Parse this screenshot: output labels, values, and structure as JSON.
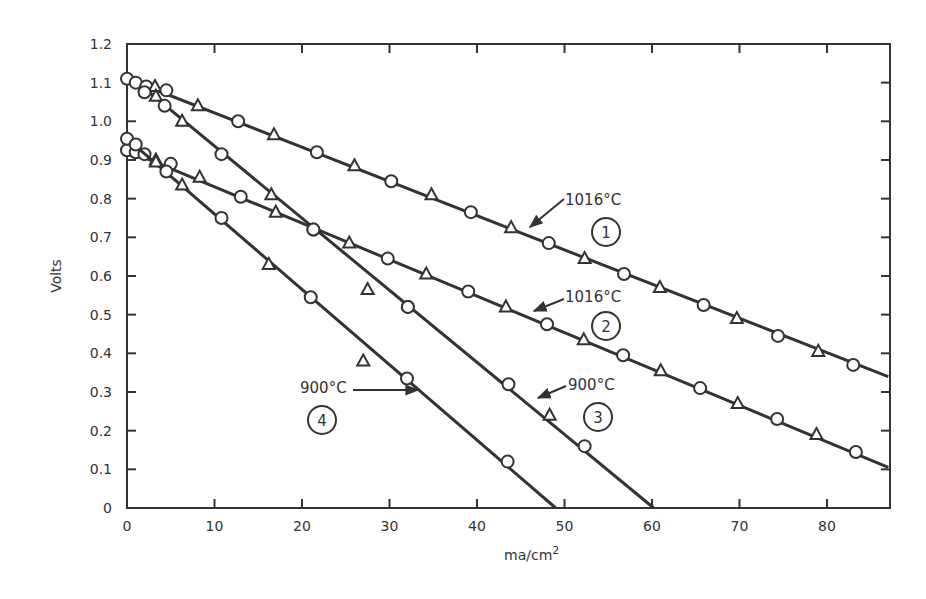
{
  "chart_data": {
    "type": "line",
    "title": "",
    "xlabel": "ma/cm",
    "xlabel_superscript": "2",
    "ylabel": "Volts",
    "xlim": [
      0,
      87
    ],
    "ylim": [
      0,
      1.2
    ],
    "grid": false,
    "legend": "none (inline annotations)",
    "x_ticks": [
      0,
      10,
      20,
      30,
      40,
      50,
      60,
      70,
      80
    ],
    "x_tick_labels": [
      "0",
      "10",
      "20",
      "30",
      "40",
      "50",
      "60",
      "70",
      "80"
    ],
    "y_ticks": [
      0,
      0.1,
      0.2,
      0.3,
      0.4,
      0.5,
      0.6,
      0.7,
      0.8,
      0.9,
      1.0,
      1.1,
      1.2
    ],
    "y_tick_labels": [
      "0",
      "0.1",
      "0.2",
      "0.3",
      "0.4",
      "0.5",
      "0.6",
      "0.7",
      "0.8",
      "0.9",
      "1.0",
      "1.1",
      "1.2"
    ],
    "series": [
      {
        "name": "1",
        "label": "1016°C",
        "line": [
          [
            0,
            1.11
          ],
          [
            87,
            0.34
          ]
        ],
        "points": [
          {
            "x": 0,
            "y": 1.11,
            "m": "o"
          },
          {
            "x": 1.0,
            "y": 1.1,
            "m": "o"
          },
          {
            "x": 2.2,
            "y": 1.09,
            "m": "o"
          },
          {
            "x": 3.2,
            "y": 1.09,
            "m": "t"
          },
          {
            "x": 4.5,
            "y": 1.08,
            "m": "o"
          },
          {
            "x": 8.1,
            "y": 1.04,
            "m": "t"
          },
          {
            "x": 12.7,
            "y": 1.0,
            "m": "o"
          },
          {
            "x": 16.8,
            "y": 0.965,
            "m": "t"
          },
          {
            "x": 21.7,
            "y": 0.92,
            "m": "o"
          },
          {
            "x": 26.0,
            "y": 0.885,
            "m": "t"
          },
          {
            "x": 30.2,
            "y": 0.845,
            "m": "o"
          },
          {
            "x": 34.8,
            "y": 0.81,
            "m": "t"
          },
          {
            "x": 39.3,
            "y": 0.765,
            "m": "o"
          },
          {
            "x": 43.9,
            "y": 0.725,
            "m": "t"
          },
          {
            "x": 48.2,
            "y": 0.685,
            "m": "o"
          },
          {
            "x": 52.3,
            "y": 0.645,
            "m": "t"
          },
          {
            "x": 56.8,
            "y": 0.605,
            "m": "o"
          },
          {
            "x": 60.9,
            "y": 0.57,
            "m": "t"
          },
          {
            "x": 65.9,
            "y": 0.525,
            "m": "o"
          },
          {
            "x": 69.7,
            "y": 0.49,
            "m": "t"
          },
          {
            "x": 74.4,
            "y": 0.445,
            "m": "o"
          },
          {
            "x": 79.0,
            "y": 0.405,
            "m": "t"
          },
          {
            "x": 83.0,
            "y": 0.37,
            "m": "o"
          }
        ]
      },
      {
        "name": "2",
        "label": "1016°C",
        "line": [
          [
            0,
            0.925
          ],
          [
            87,
            0.105
          ]
        ],
        "points": [
          {
            "x": 0,
            "y": 0.925,
            "m": "o"
          },
          {
            "x": 1.0,
            "y": 0.92,
            "m": "o"
          },
          {
            "x": 2.0,
            "y": 0.915,
            "m": "o"
          },
          {
            "x": 3.3,
            "y": 0.9,
            "m": "t"
          },
          {
            "x": 5.0,
            "y": 0.89,
            "m": "o"
          },
          {
            "x": 8.3,
            "y": 0.855,
            "m": "t"
          },
          {
            "x": 13.0,
            "y": 0.805,
            "m": "o"
          },
          {
            "x": 17.0,
            "y": 0.765,
            "m": "t"
          },
          {
            "x": 21.3,
            "y": 0.72,
            "m": "o"
          },
          {
            "x": 25.4,
            "y": 0.685,
            "m": "t"
          },
          {
            "x": 29.8,
            "y": 0.645,
            "m": "o"
          },
          {
            "x": 34.2,
            "y": 0.605,
            "m": "t"
          },
          {
            "x": 39.0,
            "y": 0.56,
            "m": "o"
          },
          {
            "x": 43.3,
            "y": 0.52,
            "m": "t"
          },
          {
            "x": 48.0,
            "y": 0.475,
            "m": "o"
          },
          {
            "x": 52.2,
            "y": 0.435,
            "m": "t"
          },
          {
            "x": 56.7,
            "y": 0.395,
            "m": "o"
          },
          {
            "x": 61.0,
            "y": 0.355,
            "m": "t"
          },
          {
            "x": 65.5,
            "y": 0.31,
            "m": "o"
          },
          {
            "x": 69.8,
            "y": 0.27,
            "m": "t"
          },
          {
            "x": 74.3,
            "y": 0.23,
            "m": "o"
          },
          {
            "x": 78.8,
            "y": 0.19,
            "m": "t"
          },
          {
            "x": 83.3,
            "y": 0.145,
            "m": "o"
          }
        ]
      },
      {
        "name": "3",
        "label": "900°C",
        "line": [
          [
            2.0,
            1.085
          ],
          [
            60.2,
            0
          ]
        ],
        "points": [
          {
            "x": 2.0,
            "y": 1.075,
            "m": "o"
          },
          {
            "x": 3.3,
            "y": 1.065,
            "m": "t"
          },
          {
            "x": 4.3,
            "y": 1.04,
            "m": "o"
          },
          {
            "x": 6.3,
            "y": 1.0,
            "m": "t"
          },
          {
            "x": 10.8,
            "y": 0.915,
            "m": "o"
          },
          {
            "x": 16.5,
            "y": 0.81,
            "m": "t"
          },
          {
            "x": 21.3,
            "y": 0.72,
            "m": "o"
          },
          {
            "x": 27.5,
            "y": 0.565,
            "m": "t"
          },
          {
            "x": 32.1,
            "y": 0.52,
            "m": "o"
          },
          {
            "x": 32.1,
            "y": 0.52,
            "m": "o"
          },
          {
            "x": 43.6,
            "y": 0.32,
            "m": "o"
          },
          {
            "x": 48.3,
            "y": 0.24,
            "m": "t"
          },
          {
            "x": 52.3,
            "y": 0.16,
            "m": "o"
          }
        ]
      },
      {
        "name": "4",
        "label": "900°C",
        "line": [
          [
            0,
            0.955
          ],
          [
            49.0,
            0
          ]
        ],
        "points": [
          {
            "x": 0,
            "y": 0.955,
            "m": "o"
          },
          {
            "x": 1.0,
            "y": 0.94,
            "m": "o"
          },
          {
            "x": 3.3,
            "y": 0.895,
            "m": "t"
          },
          {
            "x": 4.5,
            "y": 0.87,
            "m": "o"
          },
          {
            "x": 6.3,
            "y": 0.835,
            "m": "t"
          },
          {
            "x": 10.8,
            "y": 0.75,
            "m": "o"
          },
          {
            "x": 16.2,
            "y": 0.63,
            "m": "t"
          },
          {
            "x": 21.0,
            "y": 0.545,
            "m": "o"
          },
          {
            "x": 27.0,
            "y": 0.38,
            "m": "t"
          },
          {
            "x": 32.0,
            "y": 0.335,
            "m": "o"
          },
          {
            "x": 43.5,
            "y": 0.12,
            "m": "o"
          }
        ]
      }
    ],
    "annotations": [
      {
        "id": "a1",
        "text": "1016°C",
        "circle": "1",
        "text_x": 565,
        "text_y": 205,
        "circle_x": 606,
        "circle_y": 232,
        "arrow_from": [
          564,
          199
        ],
        "arrow_to": [
          530,
          227
        ]
      },
      {
        "id": "a2",
        "text": "1016°C",
        "circle": "2",
        "text_x": 565,
        "text_y": 302,
        "circle_x": 606,
        "circle_y": 326,
        "arrow_from": [
          564,
          299
        ],
        "arrow_to": [
          534,
          311
        ]
      },
      {
        "id": "a3",
        "text": "900°C",
        "circle": "3",
        "text_x": 568,
        "text_y": 390,
        "circle_x": 598,
        "circle_y": 417,
        "arrow_from": [
          566,
          386
        ],
        "arrow_to": [
          538,
          398
        ]
      },
      {
        "id": "a4",
        "text": "900°C",
        "circle": "4",
        "text_x": 300,
        "text_y": 393,
        "circle_x": 322,
        "circle_y": 420,
        "arrow_from": [
          353,
          390
        ],
        "arrow_to": [
          418,
          390
        ]
      }
    ]
  }
}
